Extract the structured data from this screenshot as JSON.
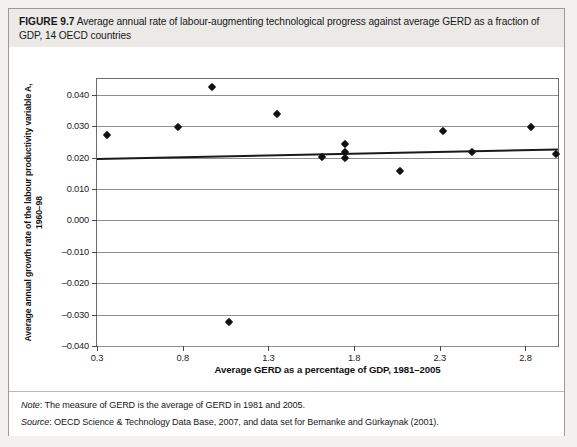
{
  "figure": {
    "label": "FIGURE 9.7",
    "caption": "Average annual rate of labour-augmenting technological progress against average GERD as a fraction of GDP, 14 OECD countries"
  },
  "notes": {
    "note_label": "Note",
    "note_text": ": The measure of GERD is the average of GERD in 1981 and 2005.",
    "source_label": "Source",
    "source_text": ": OECD Science & Technology Data Base, 2007, and data set for Bernanke and Gürkaynak (2001)."
  },
  "chart_data": {
    "type": "scatter",
    "title": "",
    "xlabel": "Average GERD as a percentage of GDP, 1981–2005",
    "ylabel": "Average annual growth rate of the labour productivity variable A, 1960–98",
    "xlim": [
      0.3,
      2.99
    ],
    "ylim": [
      -0.04,
      0.045
    ],
    "grid": true,
    "legend": "none",
    "xticks": [
      0.3,
      0.8,
      1.3,
      1.8,
      2.3,
      2.8
    ],
    "xticklabels": [
      "0.3",
      "0.8",
      "1.3",
      "1.8",
      "2.3",
      "2.8"
    ],
    "yticks": [
      0.04,
      0.03,
      0.02,
      0.01,
      0.0,
      -0.01,
      -0.02,
      -0.03,
      -0.04
    ],
    "yticklabels": [
      "0.040",
      "0.030",
      "0.020",
      "0.010",
      "0.000",
      "–0.010",
      "–0.020",
      "–0.030",
      "–0.040"
    ],
    "points": [
      {
        "x": 0.36,
        "y": 0.0273
      },
      {
        "x": 0.77,
        "y": 0.0298
      },
      {
        "x": 0.97,
        "y": 0.0425
      },
      {
        "x": 1.07,
        "y": -0.0325
      },
      {
        "x": 1.35,
        "y": 0.034
      },
      {
        "x": 1.61,
        "y": 0.0203
      },
      {
        "x": 1.75,
        "y": 0.0244
      },
      {
        "x": 1.75,
        "y": 0.0219
      },
      {
        "x": 1.75,
        "y": 0.02
      },
      {
        "x": 2.07,
        "y": 0.0156
      },
      {
        "x": 2.32,
        "y": 0.0286
      },
      {
        "x": 2.49,
        "y": 0.0219
      },
      {
        "x": 2.83,
        "y": 0.0298
      },
      {
        "x": 2.98,
        "y": 0.021
      }
    ],
    "trendline": {
      "x0": 0.3,
      "y0": 0.0198,
      "x1": 2.99,
      "y1": 0.0228
    },
    "marker_color": "#111111",
    "trendline_color": "#1a1a1a",
    "grid_color": "#8e8e8e"
  }
}
